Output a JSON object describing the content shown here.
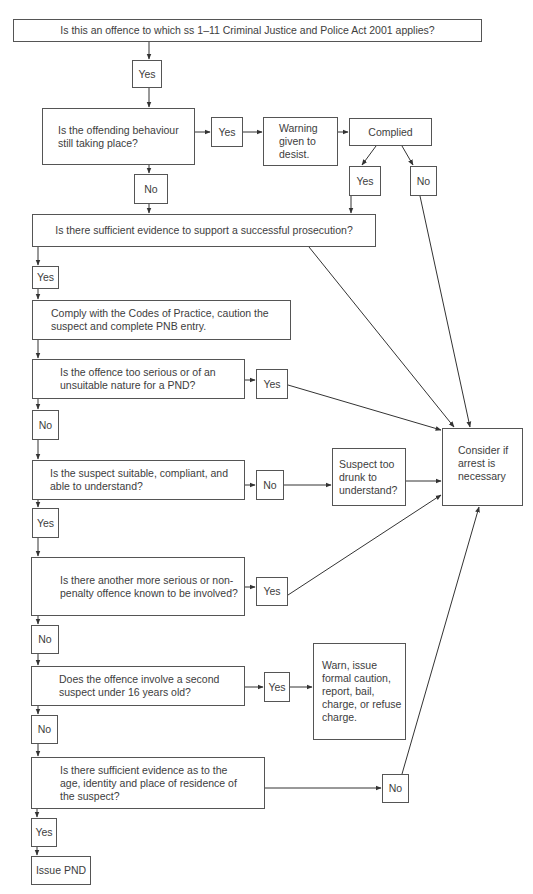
{
  "diagram": {
    "nodes": {
      "q_applies": "Is this an offence to which ss 1–11 Criminal Justice and Police Act 2001 applies?",
      "yes1": "Yes",
      "q_ongoing": "Is the offending behaviour still taking place?",
      "yes_ongoing": "Yes",
      "warning": "Warning given to desist.",
      "complied": "Complied",
      "complied_yes": "Yes",
      "complied_no": "No",
      "no_ongoing": "No",
      "q_evidence": "Is there sufficient evidence to support a successful prosecution?",
      "yes_evidence": "Yes",
      "comply_codes": "Comply with the Codes of Practice, caution the suspect and complete PNB entry.",
      "q_serious": "Is the offence too serious or of an unsuitable nature for a PND?",
      "yes_serious": "Yes",
      "no_serious": "No",
      "q_suitable": "Is the suspect suitable, compliant, and able to understand?",
      "no_suitable": "No",
      "drunk": "Suspect too drunk to understand?",
      "yes_suitable": "Yes",
      "q_another": "Is there another more serious or non-penalty offence known to be involved?",
      "yes_another": "Yes",
      "no_another": "No",
      "q_under16": "Does the offence involve a second suspect under 16 years old?",
      "yes_under16": "Yes",
      "warn_options": "Warn, issue formal caution, report, bail, charge, or refuse charge.",
      "no_under16": "No",
      "q_identity": "Is there sufficient evidence as to the age, identity and place of residence of the suspect?",
      "no_identity": "No",
      "yes_identity": "Yes",
      "issue_pnd": "Issue PND",
      "consider_arrest": "Consider if arrest is necessary"
    },
    "colors": {
      "line": "#333333",
      "border": "#555555",
      "text": "#3d3d3d"
    }
  }
}
